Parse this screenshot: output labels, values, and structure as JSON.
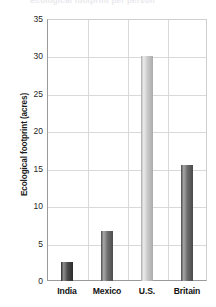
{
  "chart_data": {
    "type": "bar",
    "title": "Ecological footprint per person",
    "xlabel": "",
    "ylabel": "Ecological footprint (acres)",
    "categories": [
      "India",
      "Mexico",
      "U.S.",
      "Britain"
    ],
    "values": [
      2.5,
      6.7,
      30.0,
      15.5
    ],
    "ylim": [
      0,
      35
    ],
    "yticks": [
      0,
      5,
      10,
      15,
      20,
      25,
      30,
      35
    ],
    "ytick_labels": [
      "0",
      "5",
      "10",
      "15",
      "20",
      "25",
      "30",
      "35"
    ],
    "grid": true,
    "legend": "none",
    "bar_colors": [
      "#4a4a4a",
      "#6e6e6e",
      "#c9c9c9",
      "#6b6b6b"
    ],
    "bar_highlight_colors": [
      "#8e8e8e",
      "#a8a8a8",
      "#ececec",
      "#a5a5a5"
    ],
    "bar_shadow_colors": [
      "#2c2c2c",
      "#4d4d4d",
      "#ababab",
      "#4a4a4a"
    ]
  },
  "axis": {
    "y_title": "Ecological footprint (acres)"
  },
  "colors": {
    "gridline": "#d9d9d9",
    "axis": "#9a9a9a",
    "text": "#111111"
  }
}
